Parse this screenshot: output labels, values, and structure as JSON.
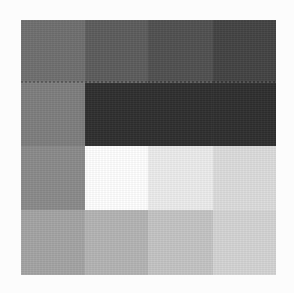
{
  "image": {
    "description": "Photographed/printed 4x4 grayscale swatch chart on white background",
    "grid": {
      "rows": 4,
      "cols": 4,
      "cells": [
        [
          "#6f6f6f",
          "#5c5c5c",
          "#505050",
          "#434343"
        ],
        [
          "#7e7e7e",
          "#2e2e2e",
          "#2e2e2e",
          "#2e2e2e"
        ],
        [
          "#8a8a8a",
          "#ffffff",
          "#ececec",
          "#dcdcdc"
        ],
        [
          "#a4a4a4",
          "#b4b4b4",
          "#c4c4c4",
          "#d4d4d4"
        ]
      ]
    },
    "background": "#fcfcfc"
  }
}
